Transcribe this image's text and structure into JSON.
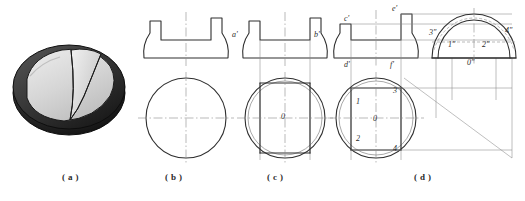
{
  "figure": {
    "background": "#ffffff",
    "line_color": "#2f2f2f",
    "thin_line_color": "#8a8a8a",
    "center_line_color": "#8c8c8c"
  },
  "panels": [
    {
      "id": "a",
      "caption": "( a )",
      "caption_x": 62,
      "caption_y": 178,
      "type": "pictorial",
      "description": "shaded 3D pictorial of a dome with slot cut",
      "body_color": "#262626",
      "face_color": "#d9d9d9",
      "highlight_color": "#efefef"
    },
    {
      "id": "b",
      "caption": "( b )",
      "caption_x": 165,
      "caption_y": 178,
      "type": "two-view",
      "views": [
        "front",
        "top"
      ],
      "labels": []
    },
    {
      "id": "c",
      "caption": "( c )",
      "caption_x": 267,
      "caption_y": 178,
      "type": "two-view",
      "views": [
        "front",
        "top"
      ],
      "labels": [
        {
          "text": "a'",
          "x": 232,
          "y": 35
        },
        {
          "text": "b'",
          "x": 314,
          "y": 35
        },
        {
          "text": "0",
          "x": 283,
          "y": 119
        }
      ]
    },
    {
      "id": "d",
      "caption": "( d )",
      "caption_x": 414,
      "caption_y": 178,
      "type": "three-view",
      "views": [
        "front",
        "top",
        "left-side"
      ],
      "miter_line": true,
      "labels": [
        {
          "text": "c'",
          "x": 344,
          "y": 20
        },
        {
          "text": "e'",
          "x": 390,
          "y": 12
        },
        {
          "text": "d'",
          "x": 345,
          "y": 65
        },
        {
          "text": "f'",
          "x": 388,
          "y": 65
        },
        {
          "text": "3\"",
          "x": 434,
          "y": 34
        },
        {
          "text": "4\"",
          "x": 504,
          "y": 33
        },
        {
          "text": "1\"",
          "x": 450,
          "y": 45
        },
        {
          "text": "2\"",
          "x": 481,
          "y": 45
        },
        {
          "text": "0\"",
          "x": 470,
          "y": 61
        },
        {
          "text": "3",
          "x": 394,
          "y": 93
        },
        {
          "text": "1",
          "x": 359,
          "y": 103
        },
        {
          "text": "0",
          "x": 376,
          "y": 122
        },
        {
          "text": "2",
          "x": 359,
          "y": 140
        },
        {
          "text": "4",
          "x": 394,
          "y": 151
        }
      ]
    }
  ]
}
